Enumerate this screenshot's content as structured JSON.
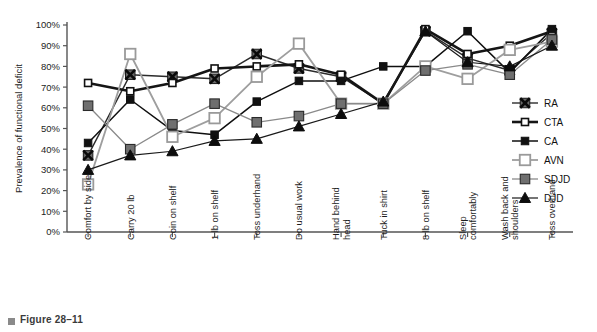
{
  "figure": {
    "caption": "Figure 28–11",
    "bullet_icon": "square-bullet-icon"
  },
  "chart_data": {
    "type": "line",
    "title": "",
    "xlabel": "",
    "ylabel": "Prevalence of functional deficit",
    "ylim": [
      0,
      100
    ],
    "ytick_labels": [
      "0%",
      "10%",
      "20%",
      "30%",
      "40%",
      "50%",
      "60%",
      "70%",
      "80%",
      "90%",
      "100%"
    ],
    "ytick_values": [
      0,
      10,
      20,
      30,
      40,
      50,
      60,
      70,
      80,
      90,
      100
    ],
    "grid": false,
    "legend_position": "right",
    "categories": [
      "Comfort by side",
      "Carry 20 lb",
      "Coin on shelf",
      "1 lb on shelf",
      "Toss underhand",
      "Do usual work",
      "Hand behind head",
      "Tuck in shirt",
      "8 lb on shelf",
      "Sleep comfortably",
      "Wash back and shoulders",
      "Toss overhand"
    ],
    "series": [
      {
        "name": "RA",
        "marker": "cross-square",
        "color": "#2a2a2a",
        "values": [
          37,
          76,
          75,
          74,
          86,
          79,
          75,
          62,
          97,
          84,
          78,
          96
        ]
      },
      {
        "name": "CTA",
        "marker": "small-open-square",
        "color": "#1a1a1a",
        "values": [
          72,
          68,
          72,
          79,
          80,
          81,
          76,
          62,
          98,
          86,
          90,
          97
        ]
      },
      {
        "name": "CA",
        "marker": "small-filled-square",
        "color": "#111111",
        "values": [
          43,
          64,
          49,
          47,
          63,
          73,
          73,
          80,
          80,
          97,
          77,
          98
        ]
      },
      {
        "name": "AVN",
        "marker": "large-open-square",
        "color": "#9a9a9a",
        "values": [
          23,
          86,
          46,
          55,
          75,
          91,
          62,
          62,
          80,
          74,
          88,
          92
        ]
      },
      {
        "name": "SDJD",
        "marker": "gray-filled-square",
        "color": "#777777",
        "values": [
          61,
          40,
          52,
          62,
          53,
          56,
          62,
          62,
          78,
          81,
          76,
          93
        ]
      },
      {
        "name": "DJD",
        "marker": "filled-triangle",
        "color": "#0d0d0d",
        "values": [
          30,
          37,
          39,
          44,
          45,
          51,
          57,
          63,
          97,
          82,
          80,
          90
        ]
      }
    ]
  },
  "legend": {
    "entries": [
      {
        "label": "RA"
      },
      {
        "label": "CTA"
      },
      {
        "label": "CA"
      },
      {
        "label": "AVN"
      },
      {
        "label": "SDJD"
      },
      {
        "label": "DJD"
      }
    ]
  }
}
